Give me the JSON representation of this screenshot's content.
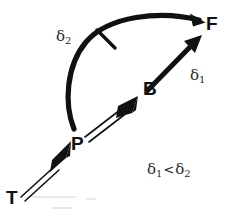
{
  "diagram": {
    "background_color": "#ffffff",
    "stroke_color": "#111111",
    "nodes": [
      {
        "id": "T",
        "label": "T",
        "x": 14,
        "y": 197
      },
      {
        "id": "P",
        "label": "P",
        "x": 78,
        "y": 143
      },
      {
        "id": "B",
        "label": "B",
        "x": 150,
        "y": 88
      },
      {
        "id": "F",
        "label": "F",
        "x": 213,
        "y": 23
      }
    ],
    "edges": [
      {
        "id": "T-to-P",
        "from": "T",
        "to": "P",
        "style": "double-line",
        "arrowhead": "filled-solid",
        "label": ""
      },
      {
        "id": "P-to-B",
        "from": "P",
        "to": "B",
        "style": "double-line",
        "arrowhead": "filled-solid",
        "label": ""
      },
      {
        "id": "B-to-F",
        "from": "B",
        "to": "F",
        "style": "thick-solid",
        "arrowhead": "filled-solid",
        "label": "delta1"
      },
      {
        "id": "P-to-F-arc",
        "from": "P",
        "to": "F",
        "style": "thick-curved-arc",
        "arrowhead": "filled-solid",
        "label": "delta2",
        "tick_mark": true
      }
    ],
    "annotations": {
      "delta2": {
        "symbol": "δ",
        "subscript": "2"
      },
      "delta1": {
        "symbol": "δ",
        "subscript": "1"
      },
      "inequality": {
        "left_symbol": "δ",
        "left_subscript": "1",
        "relation": "<",
        "right_symbol": "δ",
        "right_subscript": "2"
      }
    }
  }
}
